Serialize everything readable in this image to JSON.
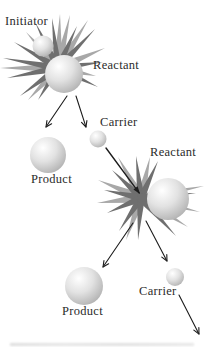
{
  "diagram": {
    "labels": {
      "initiator": "Initiator",
      "reactant1": "Reactant",
      "carrier1": "Carrier",
      "product1": "Product",
      "reactant2": "Reactant",
      "carrier2": "Carrier",
      "product2": "Product"
    },
    "colors": {
      "background": "#ffffff",
      "label_text": "#2b2b2b",
      "spike_dark": "#6f6f6f",
      "spike_light": "#a8a8a8",
      "sphere_highlight": "#ffffff",
      "sphere_mid": "#e2e2e2",
      "sphere_shade": "#bcbcbc",
      "sphere_edge": "#a4a4a4",
      "arrow": "#1c1c1c"
    }
  }
}
